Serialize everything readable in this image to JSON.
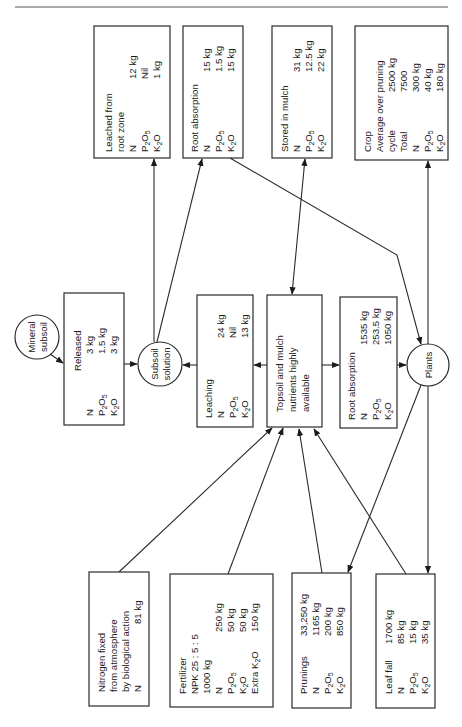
{
  "diagram": {
    "orientation": "rotated-90-ccw",
    "nodes": {
      "mineral_subsoil": {
        "type": "circle",
        "lines": [
          "Mineral",
          "subsoil"
        ]
      },
      "released": {
        "type": "box",
        "title": "Released",
        "rows": [
          {
            "label": "N",
            "value": "3 kg"
          },
          {
            "label": "P2O5",
            "value": "1.5 kg"
          },
          {
            "label": "K2O",
            "value": "3 kg"
          }
        ]
      },
      "subsoil_solution": {
        "type": "circle",
        "lines": [
          "Subsoil",
          "solution"
        ]
      },
      "leaching": {
        "type": "box",
        "title": "Leaching",
        "rows": [
          {
            "label": "N",
            "value": "24 kg"
          },
          {
            "label": "P2O5",
            "value": "Nil"
          },
          {
            "label": "K2O",
            "value": "13 kg"
          }
        ]
      },
      "topsoil": {
        "type": "box",
        "lines": [
          "Topsoil and mulch",
          "nutrients highly",
          "available"
        ]
      },
      "root_absorption_main": {
        "type": "box",
        "title": "Root absorption",
        "rows": [
          {
            "label": "N",
            "value": "1535 kg"
          },
          {
            "label": "P2O5",
            "value": "253.5 kg"
          },
          {
            "label": "K2O",
            "value": "1050 kg"
          }
        ]
      },
      "plants": {
        "type": "circle",
        "lines": [
          "Plants"
        ]
      },
      "leached_root_zone": {
        "type": "box",
        "title_lines": [
          "Leached from",
          "root zone"
        ],
        "rows": [
          {
            "label": "N",
            "value": "12 kg"
          },
          {
            "label": "P2O5",
            "value": "Nil"
          },
          {
            "label": "K2O",
            "value": "1 kg"
          }
        ]
      },
      "root_absorption_subsoil": {
        "type": "box",
        "title": "Root absorption",
        "rows": [
          {
            "label": "N",
            "value": "15 kg"
          },
          {
            "label": "P2O5",
            "value": "1.5 kg"
          },
          {
            "label": "K2O",
            "value": "15 kg"
          }
        ]
      },
      "stored_in_mulch": {
        "type": "box",
        "title": "Stored in mulch",
        "rows": [
          {
            "label": "N",
            "value": "31 kg"
          },
          {
            "label": "P2O5",
            "value": "12.5 kg"
          },
          {
            "label": "K2O",
            "value": "22 kg"
          }
        ]
      },
      "crop": {
        "type": "box",
        "lines": [
          {
            "label": "Crop",
            "value": ""
          },
          {
            "label": "Average over pruning",
            "value": ""
          },
          {
            "label": "cycle",
            "value": "2500 kg"
          },
          {
            "label": "Total",
            "value": "7500"
          }
        ],
        "rows": [
          {
            "label": "N",
            "value": "300 kg"
          },
          {
            "label": "P2O5",
            "value": "40 kg"
          },
          {
            "label": "K2O",
            "value": "180 kg"
          }
        ]
      },
      "nitrogen_fixed": {
        "type": "box",
        "title_lines": [
          "Nitrogen fixed",
          "from atmosphere",
          "by biological action"
        ],
        "rows": [
          {
            "label": "N",
            "value": "81 kg"
          }
        ]
      },
      "fertilizer": {
        "type": "box",
        "title_lines": [
          "Fertilizer",
          "NPK 25 : 5 : 5",
          "1000 kg"
        ],
        "rows": [
          {
            "label": "N",
            "value": "250 kg"
          },
          {
            "label": "P2O5",
            "value": "50 kg"
          },
          {
            "label": "K2O",
            "value": "50 kg"
          },
          {
            "label": "Extra K2O",
            "value": "150 kg"
          }
        ]
      },
      "prunings": {
        "type": "box",
        "title": "Prunings",
        "title_value": "33,250 kg",
        "rows": [
          {
            "label": "N",
            "value": "1165 kg"
          },
          {
            "label": "P2O5",
            "value": "200 kg"
          },
          {
            "label": "K2O",
            "value": "850 kg"
          }
        ]
      },
      "leaf_fall": {
        "type": "box",
        "title": "Leaf fall",
        "title_value": "1700 kg",
        "rows": [
          {
            "label": "N",
            "value": "85 kg"
          },
          {
            "label": "P2O5",
            "value": "15 kg"
          },
          {
            "label": "K2O",
            "value": "35 kg"
          }
        ]
      }
    },
    "edges": [
      {
        "from": "mineral_subsoil",
        "to": "released"
      },
      {
        "from": "released",
        "to": "subsoil_solution"
      },
      {
        "from": "subsoil_solution",
        "to": "leached_root_zone"
      },
      {
        "from": "subsoil_solution",
        "to": "root_absorption_subsoil"
      },
      {
        "from": "root_absorption_subsoil",
        "to": "plants"
      },
      {
        "from": "topsoil",
        "to": "leaching"
      },
      {
        "from": "leaching",
        "to": "subsoil_solution"
      },
      {
        "from": "topsoil",
        "to": "stored_in_mulch",
        "bidirectional": true
      },
      {
        "from": "topsoil",
        "to": "root_absorption_main"
      },
      {
        "from": "root_absorption_main",
        "to": "plants"
      },
      {
        "from": "plants",
        "to": "crop"
      },
      {
        "from": "plants",
        "to": "prunings"
      },
      {
        "from": "plants",
        "to": "leaf_fall"
      },
      {
        "from": "nitrogen_fixed",
        "to": "topsoil"
      },
      {
        "from": "fertilizer",
        "to": "topsoil"
      },
      {
        "from": "prunings",
        "to": "topsoil"
      },
      {
        "from": "leaf_fall",
        "to": "topsoil"
      }
    ]
  }
}
